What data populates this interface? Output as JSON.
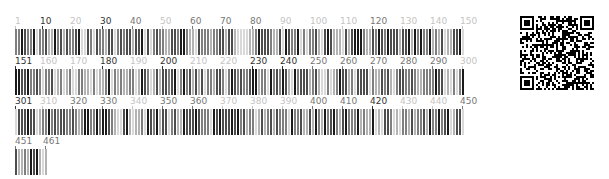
{
  "sequence": {
    "total_positions": 461,
    "positions_per_row": 150,
    "rows": [
      {
        "start": 1,
        "labels": [
          {
            "text": "1",
            "shade": "light"
          },
          {
            "text": "10",
            "shade": "dark"
          },
          {
            "text": "20",
            "shade": "light"
          },
          {
            "text": "30",
            "shade": "dark"
          },
          {
            "text": "40",
            "shade": "medium"
          },
          {
            "text": "50",
            "shade": "light"
          },
          {
            "text": "60",
            "shade": "medium"
          },
          {
            "text": "70",
            "shade": "medium"
          },
          {
            "text": "80",
            "shade": "medium"
          },
          {
            "text": "90",
            "shade": "light"
          },
          {
            "text": "100",
            "shade": "light"
          },
          {
            "text": "110",
            "shade": "light"
          },
          {
            "text": "120",
            "shade": "medium"
          },
          {
            "text": "130",
            "shade": "light"
          },
          {
            "text": "140",
            "shade": "light"
          },
          {
            "text": "150",
            "shade": "light"
          }
        ]
      },
      {
        "start": 151,
        "labels": [
          {
            "text": "151",
            "shade": "dark"
          },
          {
            "text": "160",
            "shade": "light"
          },
          {
            "text": "170",
            "shade": "light"
          },
          {
            "text": "180",
            "shade": "dark"
          },
          {
            "text": "190",
            "shade": "light"
          },
          {
            "text": "200",
            "shade": "dark"
          },
          {
            "text": "210",
            "shade": "light"
          },
          {
            "text": "220",
            "shade": "light"
          },
          {
            "text": "230",
            "shade": "dark"
          },
          {
            "text": "240",
            "shade": "dark"
          },
          {
            "text": "250",
            "shade": "medium"
          },
          {
            "text": "260",
            "shade": "medium"
          },
          {
            "text": "270",
            "shade": "medium"
          },
          {
            "text": "280",
            "shade": "medium"
          },
          {
            "text": "290",
            "shade": "medium"
          },
          {
            "text": "300",
            "shade": "light"
          }
        ]
      },
      {
        "start": 301,
        "labels": [
          {
            "text": "301",
            "shade": "dark"
          },
          {
            "text": "310",
            "shade": "light"
          },
          {
            "text": "320",
            "shade": "medium"
          },
          {
            "text": "330",
            "shade": "medium"
          },
          {
            "text": "340",
            "shade": "light"
          },
          {
            "text": "350",
            "shade": "medium"
          },
          {
            "text": "360",
            "shade": "medium"
          },
          {
            "text": "370",
            "shade": "light"
          },
          {
            "text": "380",
            "shade": "light"
          },
          {
            "text": "390",
            "shade": "light"
          },
          {
            "text": "400",
            "shade": "medium"
          },
          {
            "text": "410",
            "shade": "medium"
          },
          {
            "text": "420",
            "shade": "dark"
          },
          {
            "text": "430",
            "shade": "light"
          },
          {
            "text": "440",
            "shade": "light"
          },
          {
            "text": "450",
            "shade": "medium"
          }
        ]
      },
      {
        "start": 451,
        "labels": [
          {
            "text": "451",
            "shade": "medium"
          },
          {
            "text": "461",
            "shade": "medium"
          }
        ]
      }
    ]
  },
  "colors": {
    "bar_shades": [
      "#1a1a1a",
      "#4d4d4d",
      "#7f7f7f",
      "#b3b3b3",
      "#d9d9d9"
    ],
    "label_dark": "#333333",
    "label_medium": "#777777",
    "label_light": "#c4c4c4",
    "qr": "#000000"
  },
  "qr_code": {
    "icon": "qr-code-icon"
  }
}
